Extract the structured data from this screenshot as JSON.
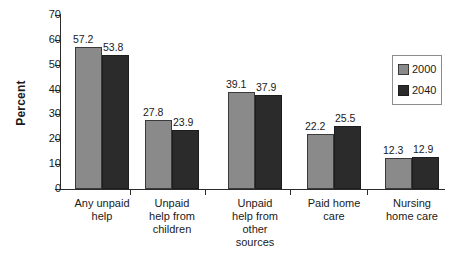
{
  "chart_data": {
    "type": "bar",
    "title": "",
    "xlabel": "",
    "ylabel": "Percent",
    "ylim": [
      0,
      70
    ],
    "ytick_step": 10,
    "yticks": [
      "70",
      "60",
      "50",
      "40",
      "30",
      "20",
      "10",
      "0"
    ],
    "grid": false,
    "legend_position": "top-right",
    "categories": [
      "Any unpaid help",
      "Unpaid help from children",
      "Unpaid help from other sources",
      "Paid home care",
      "Nursing home care"
    ],
    "category_lines": [
      [
        "Any unpaid",
        "help"
      ],
      [
        "Unpaid",
        "help from",
        "children"
      ],
      [
        "Unpaid",
        "help from",
        "other",
        "sources"
      ],
      [
        "Paid home",
        "care"
      ],
      [
        "Nursing",
        "home care"
      ]
    ],
    "series": [
      {
        "name": "2000",
        "color": "#8a8a8a",
        "values": [
          57.2,
          27.8,
          39.1,
          22.2,
          12.3
        ]
      },
      {
        "name": "2040",
        "color": "#2b2b2b",
        "values": [
          53.8,
          23.9,
          37.9,
          25.5,
          12.9
        ]
      }
    ],
    "value_labels": {
      "2000": [
        "57.2",
        "27.8",
        "39.1",
        "22.2",
        "12.3"
      ],
      "2040": [
        "53.8",
        "23.9",
        "37.9",
        "25.5",
        "12.9"
      ]
    }
  },
  "legend": {
    "items": [
      {
        "label": "2000",
        "swatch": "light-gray-swatch"
      },
      {
        "label": "2040",
        "swatch": "dark-swatch"
      }
    ]
  }
}
